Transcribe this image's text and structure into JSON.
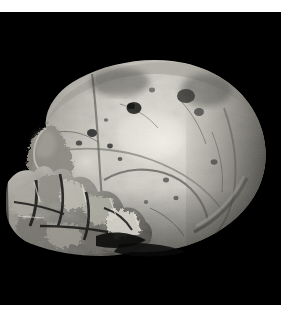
{
  "image": {
    "kind": "photograph",
    "subject": "fossil hominin cranium",
    "view": "left lateral",
    "rendering": "grayscale",
    "alt_text": "Grayscale photograph of a fossil hominin cranium in left lateral view against a black background",
    "background_color": "#000000",
    "page_color": "#ffffff",
    "plate": {
      "x": 0,
      "y": 12,
      "width": 281,
      "height": 293
    },
    "margins": {
      "top_px": 12,
      "right_px": 15,
      "bottom_px": 19,
      "left_px": 0
    },
    "palette": {
      "background": "#000000",
      "bone_shadow": "#2b2b2b",
      "bone_midtone": "#8a8a86",
      "bone_light": "#c8c8c2",
      "bone_highlight": "#efeee8",
      "pit_dark": "#1a1a1a",
      "suture_line": "#55524e",
      "page_white": "#ffffff"
    },
    "specimen_regions": [
      {
        "name": "cranial-vault",
        "label": "Cranial vault (frontal and parietal bones)",
        "tone": "light"
      },
      {
        "name": "parietal-highlight",
        "label": "Parietal highlight",
        "tone": "highlight"
      },
      {
        "name": "supraorbital-torus",
        "label": "Supraorbital / brow region",
        "tone": "midtone"
      },
      {
        "name": "temporal-bone",
        "label": "Temporal bone with suture lines",
        "tone": "midtone"
      },
      {
        "name": "occipital-torus",
        "label": "Occipital region with transverse torus ridge",
        "tone": "midtone"
      },
      {
        "name": "broken-face-fragments",
        "label": "Broken facial and basal bone fragments",
        "tone": "rough"
      },
      {
        "name": "cranial-pits",
        "label": "Dark pits and erosion holes on vault",
        "tone": "dark"
      }
    ],
    "specimen_bbox": {
      "left": 10,
      "top": 55,
      "right": 273,
      "bottom": 258
    },
    "caption": ""
  }
}
